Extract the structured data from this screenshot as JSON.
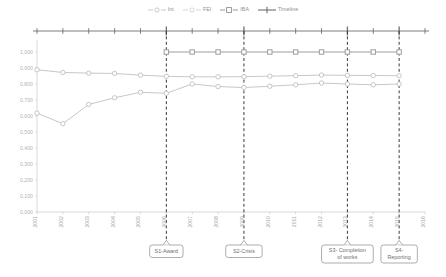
{
  "chart_data": {
    "type": "line",
    "title": "",
    "xlabel": "",
    "ylabel": "",
    "grid": false,
    "legend_position": "top-center",
    "ylim": [
      0.0,
      1.05
    ],
    "ytick_labels": [
      "1,000",
      "0,900",
      "0,800",
      "0,700",
      "0,600",
      "0,500",
      "0,400",
      "0,300",
      "0,200",
      "0,100",
      "0,000"
    ],
    "ytick_values": [
      1.0,
      0.9,
      0.8,
      0.7,
      0.6,
      0.5,
      0.4,
      0.3,
      0.2,
      0.1,
      0.0
    ],
    "categories": [
      "2001",
      "2002",
      "2003",
      "2004",
      "2005",
      "2006",
      "2007",
      "2008",
      "2009",
      "2010",
      "2011",
      "2012",
      "2013",
      "2014",
      "2015",
      "2016"
    ],
    "series": [
      {
        "name": "Int",
        "marker": "circle-open",
        "color": "#b9b9b9",
        "values": [
          0.889,
          0.872,
          0.868,
          0.866,
          0.855,
          0.848,
          0.845,
          0.845,
          0.846,
          0.849,
          0.852,
          0.856,
          0.854,
          0.853,
          0.852,
          null
        ]
      },
      {
        "name": "FEI",
        "marker": "circle-open",
        "color": "#b9b9b9",
        "values": [
          0.618,
          0.552,
          0.672,
          0.714,
          0.748,
          0.742,
          0.8,
          0.784,
          0.778,
          0.786,
          0.795,
          0.806,
          0.8,
          0.795,
          0.8,
          null
        ]
      },
      {
        "name": "IBA",
        "marker": "square-open",
        "color": "#9d9d9d",
        "values": [
          null,
          null,
          null,
          null,
          null,
          1.0,
          1.0,
          1.0,
          1.0,
          1.0,
          1.0,
          1.0,
          1.0,
          1.0,
          1.0,
          null
        ]
      }
    ],
    "timeline": {
      "name": "Timeline",
      "marker": "plus",
      "color": "#6f6f6f",
      "ticks": [
        "2001",
        "2002",
        "2003",
        "2004",
        "2005",
        "2006",
        "2007",
        "2008",
        "2009",
        "2010",
        "2011",
        "2012",
        "2013",
        "2014",
        "2015",
        "2016"
      ],
      "emphasized_ticks": [
        "2006",
        "2009",
        "2013",
        "2015"
      ]
    },
    "event_markers": [
      {
        "id": "S1",
        "year": "2006",
        "label": "S1-Award",
        "lines": [
          "S1-Award"
        ]
      },
      {
        "id": "S2",
        "year": "2009",
        "label": "S2-Crisis",
        "lines": [
          "S2-Crisis"
        ]
      },
      {
        "id": "S3",
        "year": "2013",
        "label": "S3- Completion of works",
        "lines": [
          "S3- Completion",
          "of works"
        ]
      },
      {
        "id": "S4",
        "year": "2015",
        "label": "S4- Reporting",
        "lines": [
          "S4-",
          "Reporting"
        ]
      }
    ]
  },
  "legend": {
    "items": [
      {
        "label": "Int",
        "marker": "circle-open"
      },
      {
        "label": "FEI",
        "marker": "circle-open"
      },
      {
        "label": "IBA",
        "marker": "square-open"
      },
      {
        "label": "Timeline",
        "marker": "plus"
      }
    ]
  },
  "colors": {
    "series_light": "#bdbdbd",
    "series_mid": "#9d9d9d",
    "timeline": "#6f6f6f",
    "axis": "#c8c8c8",
    "event_line": "#3a3a3a",
    "text": "#8d8d8d"
  }
}
